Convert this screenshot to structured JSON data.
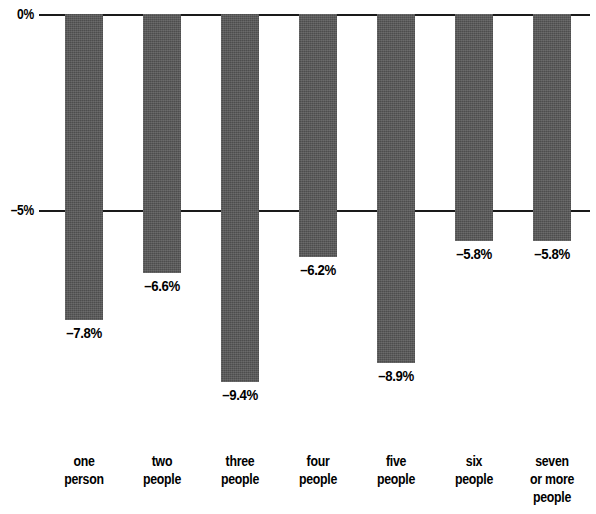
{
  "chart_data": {
    "type": "bar",
    "title": "",
    "subtitle": "",
    "xlabel": "",
    "ylabel": "",
    "categories": [
      "one person",
      "two people",
      "three people",
      "four people",
      "five people",
      "six people",
      "seven or more people"
    ],
    "category_lines": [
      [
        "one",
        "person"
      ],
      [
        "two",
        "people"
      ],
      [
        "three",
        "people"
      ],
      [
        "four",
        "people"
      ],
      [
        "five",
        "people"
      ],
      [
        "six",
        "people"
      ],
      [
        "seven",
        "or more",
        "people"
      ]
    ],
    "values": [
      -7.8,
      -6.6,
      -9.4,
      -6.2,
      -8.9,
      -5.8,
      -5.8
    ],
    "data_labels": [
      "–7.8%",
      "–6.6%",
      "–9.4%",
      "–6.2%",
      "–8.9%",
      "–5.8%",
      "–5.8%"
    ],
    "ylim": [
      -10.2,
      0
    ],
    "yticks": [
      0,
      -5
    ],
    "ytick_labels": [
      "0%",
      "–5%"
    ],
    "grid": true,
    "legend": false,
    "bar_color": "#4d4d4d",
    "axis_color": "#1a1a1a",
    "text_color": "#000000",
    "background_color": "#ffffff"
  },
  "axis": {
    "tick_zero": "0%",
    "tick_minus5": "–5%"
  },
  "bars": [
    {
      "label": "–7.8%",
      "value": -7.8,
      "cat_line1": "one",
      "cat_line2": "person",
      "cat_line3": ""
    },
    {
      "label": "–6.6%",
      "value": -6.6,
      "cat_line1": "two",
      "cat_line2": "people",
      "cat_line3": ""
    },
    {
      "label": "–9.4%",
      "value": -9.4,
      "cat_line1": "three",
      "cat_line2": "people",
      "cat_line3": ""
    },
    {
      "label": "–6.2%",
      "value": -6.2,
      "cat_line1": "four",
      "cat_line2": "people",
      "cat_line3": ""
    },
    {
      "label": "–8.9%",
      "value": -8.9,
      "cat_line1": "five",
      "cat_line2": "people",
      "cat_line3": ""
    },
    {
      "label": "–5.8%",
      "value": -5.8,
      "cat_line1": "six",
      "cat_line2": "people",
      "cat_line3": ""
    },
    {
      "label": "–5.8%",
      "value": -5.8,
      "cat_line1": "seven",
      "cat_line2": "or more",
      "cat_line3": "people"
    }
  ]
}
